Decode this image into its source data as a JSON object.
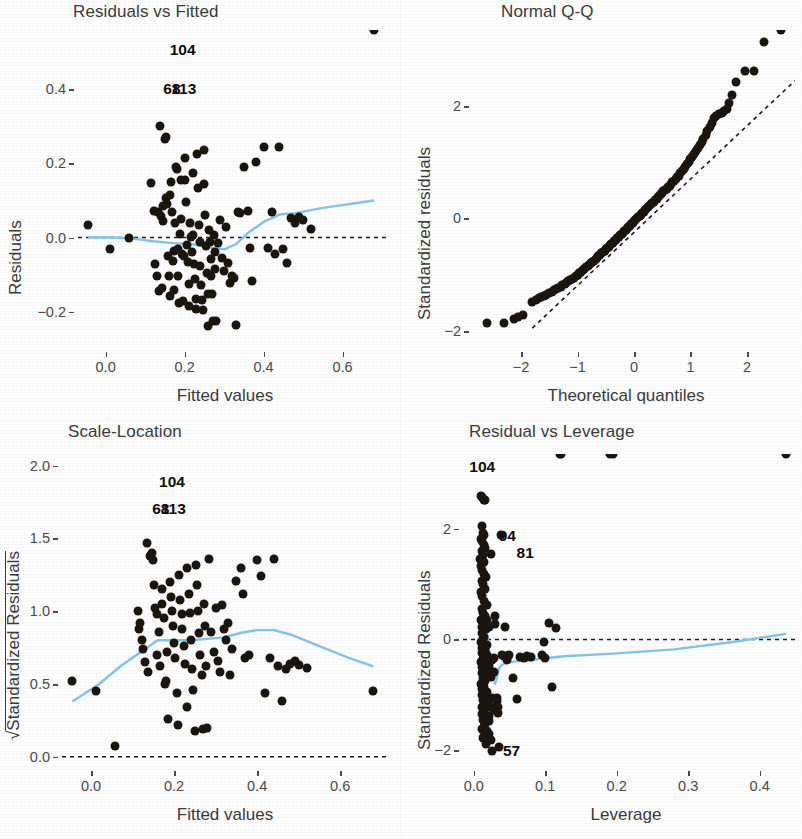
{
  "figure": {
    "background": "#ffffff",
    "point_color": "#1b1510",
    "smoother_color": "#7fc4e8",
    "reference_line_color": "#1a1a1a",
    "width": 802,
    "height": 839
  },
  "chart_data": [
    {
      "type": "scatter",
      "title": "Residuals vs Fitted",
      "xlabel": "Fitted values",
      "ylabel": "Residuals",
      "xlim": [
        -0.07,
        0.72
      ],
      "ylim": [
        -0.29,
        0.56
      ],
      "xticks": [
        0.0,
        0.2,
        0.4,
        0.6
      ],
      "xticklabels": [
        "0.0",
        "0.2",
        "0.4",
        "0.6"
      ],
      "yticks": [
        -0.2,
        0.0,
        0.2,
        0.4
      ],
      "yticklabels": [
        "-0.2",
        "0.0",
        "0.2",
        "0.4"
      ],
      "grid": false,
      "reference_line": {
        "type": "horizontal",
        "y": 0.0,
        "style": "dashed"
      },
      "annotations": [
        {
          "label": "104",
          "x": 0.195,
          "y": 0.505
        },
        {
          "label": "68",
          "x": 0.168,
          "y": 0.4
        },
        {
          "label": "113",
          "x": 0.198,
          "y": 0.4
        }
      ],
      "x": [
        -0.045,
        0.012,
        0.058,
        0.115,
        0.122,
        0.126,
        0.13,
        0.132,
        0.134,
        0.138,
        0.14,
        0.142,
        0.144,
        0.146,
        0.15,
        0.152,
        0.153,
        0.155,
        0.158,
        0.16,
        0.162,
        0.164,
        0.166,
        0.168,
        0.17,
        0.172,
        0.174,
        0.176,
        0.178,
        0.18,
        0.182,
        0.184,
        0.186,
        0.188,
        0.19,
        0.192,
        0.194,
        0.196,
        0.198,
        0.2,
        0.202,
        0.204,
        0.206,
        0.208,
        0.21,
        0.212,
        0.214,
        0.216,
        0.218,
        0.22,
        0.222,
        0.224,
        0.226,
        0.228,
        0.23,
        0.232,
        0.234,
        0.236,
        0.238,
        0.24,
        0.242,
        0.244,
        0.246,
        0.248,
        0.25,
        0.252,
        0.254,
        0.256,
        0.258,
        0.26,
        0.262,
        0.264,
        0.266,
        0.268,
        0.27,
        0.272,
        0.274,
        0.276,
        0.278,
        0.28,
        0.285,
        0.29,
        0.295,
        0.3,
        0.305,
        0.31,
        0.315,
        0.32,
        0.325,
        0.33,
        0.335,
        0.34,
        0.35,
        0.36,
        0.365,
        0.37,
        0.38,
        0.4,
        0.41,
        0.42,
        0.43,
        0.44,
        0.45,
        0.46,
        0.47,
        0.48,
        0.49,
        0.5,
        0.52,
        0.68
      ],
      "y": [
        0.035,
        -0.03,
        0.0,
        0.146,
        0.072,
        -0.072,
        -0.105,
        0.068,
        -0.145,
        0.3,
        0.058,
        -0.135,
        0.085,
        0.045,
        0.265,
        0.272,
        0.106,
        0.09,
        -0.05,
        -0.105,
        -0.158,
        0.115,
        0.15,
        0.07,
        -0.062,
        -0.035,
        -0.142,
        0.04,
        0.19,
        0.185,
        -0.03,
        -0.105,
        -0.178,
        0.01,
        0.155,
        0.05,
        -0.045,
        -0.172,
        -0.05,
        0.215,
        0.155,
        0.095,
        -0.02,
        -0.065,
        -0.125,
        -0.185,
        0.04,
        0.001,
        -0.038,
        0.175,
        0.006,
        -0.072,
        -0.112,
        -0.165,
        -0.192,
        0.225,
        0.135,
        0.035,
        -0.012,
        -0.078,
        -0.128,
        -0.168,
        -0.195,
        0.235,
        0.145,
        0.062,
        -0.022,
        -0.096,
        -0.152,
        -0.238,
        0.02,
        -0.013,
        -0.058,
        -0.103,
        -0.152,
        -0.225,
        0.007,
        -0.04,
        -0.085,
        -0.225,
        -0.015,
        0.046,
        -0.055,
        -0.09,
        0.028,
        -0.07,
        -0.122,
        -0.105,
        -0.11,
        -0.235,
        0.068,
        0.065,
        0.19,
        0.072,
        -0.028,
        -0.118,
        0.205,
        0.245,
        -0.028,
        0.068,
        -0.045,
        0.245,
        -0.03,
        -0.068,
        0.053,
        0.04,
        0.055,
        0.048,
        0.022
      ],
      "smoother_x": [
        -0.045,
        0.02,
        0.07,
        0.12,
        0.17,
        0.22,
        0.27,
        0.3,
        0.33,
        0.36,
        0.4,
        0.44,
        0.48,
        0.55,
        0.68
      ],
      "smoother_y": [
        0.0,
        0.0,
        -0.003,
        -0.01,
        -0.015,
        -0.018,
        -0.028,
        -0.032,
        -0.018,
        0.012,
        0.042,
        0.062,
        0.066,
        0.08,
        0.1
      ]
    },
    {
      "type": "scatter",
      "title": "Normal Q-Q",
      "xlabel": "Theoretical quantiles",
      "ylabel": "Standardized residuals",
      "xlim": [
        -2.85,
        2.85
      ],
      "ylim": [
        -2.25,
        3.35
      ],
      "xticks": [
        -2,
        -1,
        0,
        1,
        2
      ],
      "xticklabels": [
        "-2",
        "-1",
        "0",
        "1",
        "2"
      ],
      "yticks": [
        -2,
        0,
        2
      ],
      "yticklabels": [
        "-2",
        "0",
        "2"
      ],
      "grid": false,
      "reference_line": {
        "type": "qq-line",
        "style": "dashed"
      },
      "annotations": [],
      "x": [
        -2.6,
        -2.3,
        -2.12,
        -2.05,
        -1.96,
        -1.8,
        -1.74,
        -1.69,
        -1.64,
        -1.59,
        -1.55,
        -1.5,
        -1.46,
        -1.42,
        -1.38,
        -1.34,
        -1.3,
        -1.27,
        -1.23,
        -1.2,
        -1.16,
        -1.13,
        -1.1,
        -1.06,
        -1.03,
        -1.0,
        -0.97,
        -0.94,
        -0.91,
        -0.88,
        -0.85,
        -0.82,
        -0.79,
        -0.77,
        -0.74,
        -0.71,
        -0.68,
        -0.66,
        -0.63,
        -0.6,
        -0.58,
        -0.55,
        -0.52,
        -0.5,
        -0.47,
        -0.45,
        -0.42,
        -0.4,
        -0.37,
        -0.35,
        -0.32,
        -0.3,
        -0.27,
        -0.25,
        -0.22,
        -0.2,
        -0.17,
        -0.15,
        -0.12,
        -0.1,
        -0.07,
        -0.05,
        -0.02,
        0.0,
        0.02,
        0.05,
        0.07,
        0.1,
        0.12,
        0.15,
        0.17,
        0.2,
        0.22,
        0.25,
        0.27,
        0.3,
        0.32,
        0.35,
        0.37,
        0.4,
        0.42,
        0.45,
        0.47,
        0.5,
        0.52,
        0.55,
        0.58,
        0.6,
        0.63,
        0.66,
        0.68,
        0.71,
        0.74,
        0.77,
        0.79,
        0.82,
        0.85,
        0.88,
        0.91,
        0.94,
        0.97,
        1.0,
        1.03,
        1.06,
        1.1,
        1.13,
        1.16,
        1.2,
        1.23,
        1.27,
        1.3,
        1.34,
        1.38,
        1.42,
        1.46,
        1.5,
        1.55,
        1.59,
        1.64,
        1.69,
        1.74,
        1.8,
        1.96,
        2.12,
        2.3,
        2.6
      ],
      "y": [
        -1.86,
        -1.86,
        -1.78,
        -1.76,
        -1.72,
        -1.48,
        -1.45,
        -1.42,
        -1.4,
        -1.38,
        -1.36,
        -1.33,
        -1.31,
        -1.28,
        -1.26,
        -1.24,
        -1.21,
        -1.19,
        -1.17,
        -1.14,
        -1.12,
        -1.1,
        -1.07,
        -1.05,
        -1.02,
        -1.0,
        -0.97,
        -0.95,
        -0.92,
        -0.9,
        -0.87,
        -0.85,
        -0.82,
        -0.8,
        -0.77,
        -0.75,
        -0.72,
        -0.7,
        -0.67,
        -0.65,
        -0.62,
        -0.6,
        -0.57,
        -0.55,
        -0.52,
        -0.5,
        -0.48,
        -0.45,
        -0.43,
        -0.4,
        -0.38,
        -0.35,
        -0.33,
        -0.3,
        -0.28,
        -0.25,
        -0.23,
        -0.2,
        -0.18,
        -0.15,
        -0.13,
        -0.1,
        -0.08,
        -0.05,
        -0.03,
        0.0,
        0.02,
        0.05,
        0.07,
        0.1,
        0.12,
        0.15,
        0.17,
        0.2,
        0.22,
        0.25,
        0.27,
        0.3,
        0.33,
        0.35,
        0.38,
        0.4,
        0.43,
        0.45,
        0.48,
        0.5,
        0.53,
        0.56,
        0.58,
        0.61,
        0.64,
        0.67,
        0.7,
        0.73,
        0.76,
        0.8,
        0.84,
        0.88,
        0.92,
        0.96,
        1.0,
        1.05,
        1.1,
        1.15,
        1.2,
        1.25,
        1.3,
        1.36,
        1.42,
        1.48,
        1.55,
        1.62,
        1.7,
        1.78,
        1.83,
        1.86,
        1.88,
        1.91,
        1.94,
        2.05,
        2.2,
        2.43,
        2.62,
        2.63,
        3.13
      ],
      "ref_x": [
        -1.8,
        2.85
      ],
      "ref_y": [
        -1.95,
        2.45
      ]
    },
    {
      "type": "scatter",
      "title": "Scale-Location",
      "xlabel": "Fitted values",
      "ylabel": "√Standardized Residuals",
      "xlim": [
        -0.07,
        0.72
      ],
      "ylim": [
        -0.05,
        2.08
      ],
      "xticks": [
        0.0,
        0.2,
        0.4,
        0.6
      ],
      "xticklabels": [
        "0.0",
        "0.2",
        "0.4",
        "0.6"
      ],
      "yticks": [
        0.0,
        0.5,
        1.0,
        1.5,
        2.0
      ],
      "yticklabels": [
        "0.0",
        "0.5",
        "1.0",
        "1.5",
        "2.0"
      ],
      "grid": false,
      "reference_line": {
        "type": "horizontal",
        "y": 0.0,
        "style": "dashed"
      },
      "annotations": [
        {
          "label": "104",
          "x": 0.195,
          "y": 1.89
        },
        {
          "label": "68",
          "x": 0.168,
          "y": 1.7
        },
        {
          "label": "113",
          "x": 0.198,
          "y": 1.7
        }
      ],
      "x": [
        -0.045,
        0.012,
        0.058,
        0.112,
        0.115,
        0.118,
        0.122,
        0.126,
        0.13,
        0.134,
        0.138,
        0.142,
        0.146,
        0.15,
        0.152,
        0.155,
        0.158,
        0.16,
        0.163,
        0.166,
        0.17,
        0.172,
        0.175,
        0.178,
        0.18,
        0.183,
        0.186,
        0.19,
        0.192,
        0.195,
        0.198,
        0.2,
        0.203,
        0.206,
        0.21,
        0.212,
        0.215,
        0.218,
        0.22,
        0.223,
        0.226,
        0.23,
        0.232,
        0.235,
        0.238,
        0.24,
        0.243,
        0.246,
        0.25,
        0.252,
        0.255,
        0.258,
        0.26,
        0.263,
        0.266,
        0.27,
        0.272,
        0.275,
        0.278,
        0.28,
        0.285,
        0.29,
        0.295,
        0.3,
        0.305,
        0.31,
        0.315,
        0.32,
        0.325,
        0.33,
        0.335,
        0.34,
        0.35,
        0.36,
        0.365,
        0.37,
        0.38,
        0.4,
        0.41,
        0.42,
        0.43,
        0.44,
        0.45,
        0.46,
        0.47,
        0.48,
        0.49,
        0.5,
        0.52,
        0.68
      ],
      "y": [
        0.52,
        0.45,
        0.075,
        1.0,
        0.88,
        0.92,
        0.8,
        0.74,
        0.65,
        1.47,
        0.58,
        1.38,
        1.4,
        1.35,
        1.18,
        1.02,
        0.7,
        0.98,
        0.86,
        0.62,
        1.15,
        1.05,
        0.95,
        0.5,
        0.52,
        0.72,
        0.26,
        1.2,
        1.1,
        1.0,
        0.9,
        0.78,
        0.68,
        0.44,
        0.22,
        1.25,
        1.08,
        0.98,
        0.88,
        0.76,
        0.64,
        0.34,
        1.3,
        1.12,
        0.99,
        0.8,
        0.6,
        0.46,
        0.18,
        1.32,
        1.18,
        1.0,
        0.85,
        0.7,
        0.56,
        0.19,
        1.05,
        0.9,
        0.62,
        0.2,
        1.36,
        0.86,
        0.72,
        1.02,
        0.66,
        0.58,
        1.04,
        0.88,
        0.8,
        0.92,
        0.56,
        0.74,
        1.21,
        1.3,
        1.12,
        0.68,
        0.7,
        1.35,
        1.24,
        0.44,
        0.68,
        1.36,
        0.62,
        0.38,
        0.6,
        0.64,
        0.66,
        0.63,
        0.61,
        0.45
      ],
      "smoother_x": [
        -0.045,
        0.02,
        0.07,
        0.12,
        0.16,
        0.2,
        0.24,
        0.28,
        0.32,
        0.36,
        0.4,
        0.44,
        0.48,
        0.55,
        0.62,
        0.68
      ],
      "smoother_y": [
        0.38,
        0.5,
        0.62,
        0.72,
        0.8,
        0.8,
        0.8,
        0.81,
        0.82,
        0.85,
        0.87,
        0.87,
        0.84,
        0.76,
        0.68,
        0.62
      ]
    },
    {
      "type": "scatter",
      "title": "Residual vs Leverage",
      "xlabel": "Leverage",
      "ylabel": "Standardized Residuals",
      "xlim": [
        -0.015,
        0.455
      ],
      "ylim": [
        -2.25,
        3.35
      ],
      "xticks": [
        0.0,
        0.1,
        0.2,
        0.3,
        0.4
      ],
      "xticklabels": [
        "0.0",
        "0.1",
        "0.2",
        "0.3",
        "0.4"
      ],
      "yticks": [
        -2,
        0,
        2
      ],
      "yticklabels": [
        "-2",
        "0",
        "2"
      ],
      "grid": false,
      "reference_line": {
        "type": "horizontal",
        "y": 0.0,
        "style": "dashed"
      },
      "annotations": [
        {
          "label": "104",
          "x": 0.012,
          "y": 3.12
        },
        {
          "label": "94",
          "x": 0.047,
          "y": 1.86
        },
        {
          "label": "81",
          "x": 0.072,
          "y": 1.57
        },
        {
          "label": "57",
          "x": 0.053,
          "y": -2.02
        }
      ],
      "x": [
        0.01,
        0.012,
        0.014,
        0.016,
        0.011,
        0.013,
        0.015,
        0.01,
        0.012,
        0.014,
        0.016,
        0.011,
        0.013,
        0.009,
        0.015,
        0.01,
        0.012,
        0.014,
        0.017,
        0.011,
        0.013,
        0.016,
        0.01,
        0.012,
        0.015,
        0.018,
        0.011,
        0.013,
        0.016,
        0.01,
        0.014,
        0.012,
        0.017,
        0.011,
        0.015,
        0.013,
        0.01,
        0.018,
        0.012,
        0.016,
        0.011,
        0.014,
        0.013,
        0.01,
        0.017,
        0.012,
        0.015,
        0.011,
        0.019,
        0.013,
        0.016,
        0.01,
        0.014,
        0.012,
        0.018,
        0.011,
        0.015,
        0.013,
        0.02,
        0.017,
        0.012,
        0.016,
        0.014,
        0.011,
        0.019,
        0.013,
        0.022,
        0.016,
        0.014,
        0.012,
        0.018,
        0.021,
        0.015,
        0.013,
        0.024,
        0.017,
        0.019,
        0.014,
        0.026,
        0.016,
        0.022,
        0.018,
        0.028,
        0.02,
        0.024,
        0.016,
        0.03,
        0.022,
        0.018,
        0.026,
        0.032,
        0.02,
        0.024,
        0.028,
        0.034,
        0.022,
        0.03,
        0.018,
        0.036,
        0.026,
        0.038,
        0.024,
        0.032,
        0.04,
        0.028,
        0.044,
        0.034,
        0.046,
        0.048,
        0.05,
        0.042,
        0.055,
        0.06,
        0.065,
        0.07,
        0.075,
        0.08,
        0.095,
        0.098,
        0.1,
        0.105,
        0.11,
        0.115,
        0.12,
        0.122,
        0.19,
        0.195,
        0.437
      ],
      "y": [
        2.6,
        2.58,
        2.52,
        2.52,
        2.05,
        1.92,
        1.88,
        1.82,
        1.78,
        1.7,
        1.66,
        1.6,
        1.52,
        1.45,
        1.4,
        1.32,
        1.25,
        1.18,
        1.12,
        1.05,
        1.0,
        0.92,
        0.85,
        0.78,
        0.7,
        0.62,
        0.55,
        0.48,
        0.42,
        0.35,
        0.3,
        0.22,
        0.18,
        0.12,
        0.05,
        0.0,
        -0.05,
        -0.1,
        -0.15,
        -0.2,
        -0.25,
        -0.3,
        -0.35,
        -0.4,
        -0.45,
        -0.5,
        -0.55,
        -0.6,
        -0.65,
        -0.7,
        -0.75,
        -0.8,
        -0.85,
        -0.9,
        -0.95,
        -1.0,
        -1.05,
        -1.1,
        -1.12,
        -1.18,
        -1.22,
        -1.25,
        -1.3,
        -1.35,
        -1.4,
        -1.45,
        -1.48,
        -1.52,
        -1.58,
        -1.62,
        -1.65,
        -1.7,
        -1.75,
        -1.78,
        -1.82,
        -1.88,
        -0.28,
        -0.32,
        -0.38,
        -0.42,
        -0.48,
        -0.52,
        -0.58,
        -0.62,
        -0.68,
        -0.72,
        0.28,
        0.22,
        0.35,
        -1.05,
        -1.12,
        -1.18,
        -1.22,
        -1.28,
        -1.32,
        -1.38,
        0.42,
        -0.32,
        -1.95,
        -2.02,
        1.88,
        1.55,
        -1.05,
        -0.28,
        -0.34,
        0.22,
        -1.22,
        -0.38,
        -0.3,
        -0.28,
        -0.3,
        -0.7,
        -1.08,
        -0.32,
        -0.34,
        -0.3,
        -0.32,
        -0.28,
        -0.04,
        -0.34,
        0.3,
        -0.85,
        0.2
      ],
      "smoother_x": [
        0.01,
        0.018,
        0.024,
        0.03,
        0.036,
        0.044,
        0.055,
        0.075,
        0.1,
        0.13,
        0.19,
        0.28,
        0.36,
        0.437
      ],
      "smoother_y": [
        0.3,
        0.18,
        -0.45,
        -0.8,
        -0.5,
        -0.42,
        -0.4,
        -0.38,
        -0.34,
        -0.3,
        -0.26,
        -0.18,
        -0.05,
        0.1
      ]
    }
  ]
}
